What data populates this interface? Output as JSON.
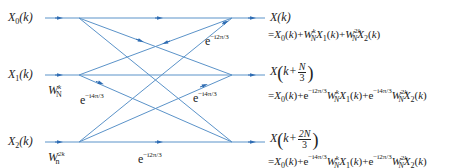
{
  "inputs": [
    {
      "label_main": "X",
      "label_sub": "0",
      "label_arg": "(k)"
    },
    {
      "label_main": "X",
      "label_sub": "1",
      "label_arg": "(k)"
    },
    {
      "label_main": "X",
      "label_sub": "2",
      "label_arg": "(k)"
    }
  ],
  "twiddles": [
    {
      "base": "W",
      "sup": "k",
      "sub": "N"
    },
    {
      "base": "W",
      "sup": "2k",
      "sub": "n"
    }
  ],
  "branch_weights": [
    {
      "base": "e",
      "exp": "−i2π/3",
      "position": "upper-right"
    },
    {
      "base": "e",
      "exp": "−i4π/3",
      "position": "middle-left"
    },
    {
      "base": "e",
      "exp": "−i4π/3",
      "position": "middle-right"
    },
    {
      "base": "e",
      "exp": "−i2π/3",
      "position": "bottom-middle"
    }
  ],
  "outputs": [
    {
      "label": "X(k)",
      "equation": {
        "prefix": "=X",
        "parts": [
          "0",
          "(k)+W",
          "k",
          "N",
          "X",
          "1",
          "(k)+W",
          "2k",
          "N",
          "X",
          "2",
          "(k)"
        ]
      }
    },
    {
      "label_prefix": "X",
      "label_k": "k+",
      "label_num": "N",
      "label_den": "3",
      "equation": {
        "e1": "−i2π/3",
        "e2": "−i4π/3"
      }
    },
    {
      "label_prefix": "X",
      "label_k": "k+",
      "label_num": "2N",
      "label_den": "3",
      "equation": {
        "e1": "−i4π/3",
        "e2": "−i2π/3"
      }
    }
  ],
  "colors": {
    "line": "#5b93c9",
    "arrow": "#2f6db3",
    "text": "#222222"
  }
}
